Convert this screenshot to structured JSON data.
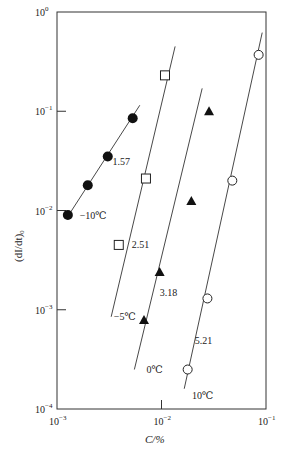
{
  "chart_data": {
    "type": "scatter",
    "title": "",
    "xlabel": "C/%",
    "ylabel": "(dI/dt)₀",
    "xscale": "log",
    "yscale": "log",
    "xlim": [
      0.001,
      0.1
    ],
    "ylim": [
      0.0001,
      1
    ],
    "grid": false,
    "x_ticks": [
      {
        "value": 0.001,
        "label": "10",
        "exp": "−3"
      },
      {
        "value": 0.01,
        "label": "10",
        "exp": "−2"
      },
      {
        "value": 0.1,
        "label": "10",
        "exp": "−1"
      }
    ],
    "y_ticks": [
      {
        "value": 1,
        "label": "10",
        "exp": "0"
      },
      {
        "value": 0.1,
        "label": "10",
        "exp": "−1"
      },
      {
        "value": 0.01,
        "label": "10",
        "exp": "−2"
      },
      {
        "value": 0.001,
        "label": "10",
        "exp": "−3"
      },
      {
        "value": 0.0001,
        "label": "10",
        "exp": "−4"
      }
    ],
    "series": [
      {
        "name": "−10℃",
        "marker": "filled-circle",
        "slope_label": "1.57",
        "x": [
          0.00127,
          0.00197,
          0.00306,
          0.0053
        ],
        "y": [
          0.009,
          0.018,
          0.035,
          0.085
        ],
        "fit_line": {
          "x": [
            0.00125,
            0.0062
          ],
          "y": [
            0.0085,
            0.115
          ]
        }
      },
      {
        "name": "−5℃",
        "marker": "open-square",
        "slope_label": "2.51",
        "x": [
          0.0039,
          0.0071,
          0.0108
        ],
        "y": [
          0.0045,
          0.021,
          0.23
        ],
        "fit_line": {
          "x": [
            0.0033,
            0.0135
          ],
          "y": [
            0.00085,
            0.45
          ]
        }
      },
      {
        "name": "0℃",
        "marker": "filled-triangle",
        "slope_label": "3.18",
        "x": [
          0.0068,
          0.0096,
          0.0193,
          0.0285
        ],
        "y": [
          0.00079,
          0.0024,
          0.0125,
          0.1
        ],
        "fit_line": {
          "x": [
            0.0055,
            0.0245
          ],
          "y": [
            0.00025,
            0.17
          ]
        }
      },
      {
        "name": "10℃",
        "marker": "open-circle",
        "slope_label": "5.21",
        "x": [
          0.0178,
          0.0275,
          0.0476,
          0.085
        ],
        "y": [
          0.00025,
          0.0013,
          0.02,
          0.37
        ],
        "fit_line": {
          "x": [
            0.0165,
            0.092
          ],
          "y": [
            0.00016,
            0.62
          ]
        }
      }
    ],
    "annotations": [
      {
        "text": "1.57",
        "x": 0.0034,
        "y": 0.0285
      },
      {
        "text": "−10℃",
        "x": 0.00165,
        "y": 0.0082
      },
      {
        "text": "2.51",
        "x": 0.0052,
        "y": 0.0042
      },
      {
        "text": "−5℃",
        "x": 0.0035,
        "y": 0.00078
      },
      {
        "text": "3.18",
        "x": 0.0096,
        "y": 0.00138
      },
      {
        "text": "0℃",
        "x": 0.0072,
        "y": 0.00023
      },
      {
        "text": "5.21",
        "x": 0.0208,
        "y": 0.00045
      },
      {
        "text": "10℃",
        "x": 0.0196,
        "y": 0.000125
      }
    ]
  }
}
